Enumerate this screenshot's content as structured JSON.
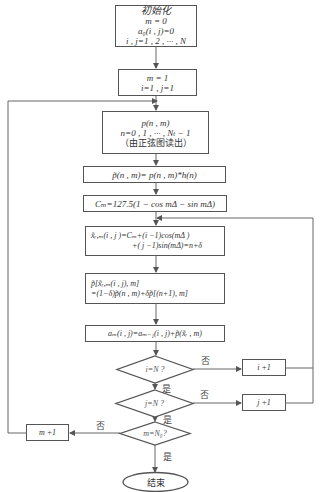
{
  "flowchart": {
    "init": {
      "title": "初始化",
      "lines": [
        "m = 0",
        "a₀(i , j)=0",
        "i , j=1 , 2 , ··· , N"
      ]
    },
    "set_m1": {
      "lines": [
        "m = 1",
        "i=1 , j=1"
      ]
    },
    "read_p": {
      "lines": [
        "p(n , m)",
        "n=0 , 1 , ··· , Nₜ − 1",
        "（由正弦图读出）"
      ]
    },
    "filter": {
      "text": "p̃(n , m)= p(n , m)*h(n)"
    },
    "cm": {
      "text": "Cₘ=127.5(1 − cos mΔ − sin mΔ)"
    },
    "xr": {
      "lines": [
        "x̃ᵣ,ₘ(i , j )=Cₘ+(i −1)cos(mΔ )",
        "+( j −1)sin(mΔ)=n+δ"
      ]
    },
    "interp": {
      "lines": [
        "p̃[x̃ᵣ,ₘ(i , j), m]",
        "=(1−δ)p̃(n , m)+δp̃[(n+1), m]"
      ]
    },
    "accum": {
      "text": "aₘ(i , j)=aₘ₋₁(i , j)+p̃(x̃ᵣ , m)"
    },
    "dec_i": {
      "text": "i=N ?"
    },
    "dec_j": {
      "text": "j=N ?"
    },
    "dec_m": {
      "text": "m=N₀?"
    },
    "inc_i": {
      "text": "i +1"
    },
    "inc_j": {
      "text": "j +1"
    },
    "inc_m": {
      "text": "m +1"
    },
    "end": {
      "text": "结束"
    },
    "labels": {
      "no_i": "否",
      "no_j": "否",
      "no_m": "否",
      "yes_i": "是",
      "yes_j": "是",
      "yes_m": "是"
    }
  }
}
